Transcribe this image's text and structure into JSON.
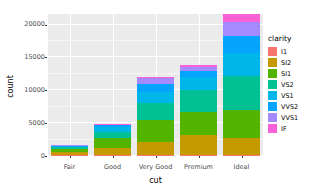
{
  "chart_data": {
    "type": "bar",
    "title": "",
    "subtitle": "",
    "xlabel": "cut",
    "ylabel": "count",
    "stacked": true,
    "orientation": "vertical",
    "grid": true,
    "legend_position": "right",
    "legend_title": "clarity",
    "categories": [
      "Fair",
      "Good",
      "Very Good",
      "Premium",
      "Ideal"
    ],
    "ylim": [
      0,
      21600
    ],
    "yticks": [
      0,
      5000,
      10000,
      15000,
      20000
    ],
    "ytick_labels": [
      "0",
      "5000",
      "10000",
      "15000",
      "20000"
    ],
    "series": [
      {
        "name": "I1",
        "color": "#F8766D",
        "values": [
          210,
          96,
          84,
          205,
          146
        ]
      },
      {
        "name": "SI2",
        "color": "#C49A00",
        "values": [
          466,
          1081,
          2100,
          2949,
          2598
        ]
      },
      {
        "name": "SI1",
        "color": "#53B400",
        "values": [
          408,
          1560,
          3240,
          3575,
          4282
        ]
      },
      {
        "name": "VS2",
        "color": "#00C094",
        "values": [
          261,
          978,
          2591,
          3357,
          5071
        ]
      },
      {
        "name": "VS1",
        "color": "#00B6EB",
        "values": [
          170,
          648,
          1775,
          1989,
          3589
        ]
      },
      {
        "name": "VVS2",
        "color": "#06A4FF",
        "values": [
          69,
          286,
          1235,
          870,
          2606
        ]
      },
      {
        "name": "VVS1",
        "color": "#A58AFF",
        "values": [
          17,
          186,
          789,
          616,
          2047
        ]
      },
      {
        "name": "IF",
        "color": "#FB61D7",
        "values": [
          9,
          71,
          268,
          230,
          1212
        ]
      }
    ],
    "totals": [
      1610,
      4906,
      12082,
      13791,
      21551
    ],
    "panel_background": "#EBEBEB",
    "gridline_color": "#FFFFFF"
  },
  "legend": {
    "title": "clarity",
    "items": [
      {
        "label": "I1",
        "color": "#F8766D"
      },
      {
        "label": "SI2",
        "color": "#C49A00"
      },
      {
        "label": "SI1",
        "color": "#53B400"
      },
      {
        "label": "VS2",
        "color": "#00C094"
      },
      {
        "label": "VS1",
        "color": "#00B6EB"
      },
      {
        "label": "VVS2",
        "color": "#06A4FF"
      },
      {
        "label": "VVS1",
        "color": "#A58AFF"
      },
      {
        "label": "IF",
        "color": "#FB61D7"
      }
    ]
  }
}
